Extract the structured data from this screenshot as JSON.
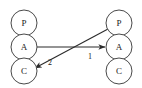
{
  "diagram": {
    "type": "graph",
    "canvas": {
      "width": 142,
      "height": 88,
      "background": "#ffffff"
    },
    "style": {
      "node_stroke": "#4a4a4a",
      "node_fill": "#ffffff",
      "edge_color": "#2b2b2b",
      "text_color": "#1a1a1a"
    },
    "columns": [
      {
        "name": "left-column",
        "cx": 24,
        "nodes": [
          {
            "id": "left-p",
            "label": "P",
            "cx": 24,
            "cy": 23,
            "r": 13
          },
          {
            "id": "left-a",
            "label": "A",
            "cx": 24,
            "cy": 47,
            "r": 13
          },
          {
            "id": "left-c",
            "label": "C",
            "cx": 24,
            "cy": 71,
            "r": 13
          }
        ]
      },
      {
        "name": "right-column",
        "cx": 119,
        "nodes": [
          {
            "id": "right-p",
            "label": "P",
            "cx": 119,
            "cy": 23,
            "r": 13
          },
          {
            "id": "right-a",
            "label": "A",
            "cx": 119,
            "cy": 47,
            "r": 13
          },
          {
            "id": "right-c",
            "label": "C",
            "cx": 119,
            "cy": 71,
            "r": 13
          }
        ]
      }
    ],
    "edges": [
      {
        "id": "edge-1",
        "label": "1",
        "from": "left-a",
        "to": "right-a",
        "arrowhead": "to",
        "label_x": 90,
        "label_y": 56
      },
      {
        "id": "edge-2",
        "label": "2",
        "from": "right-p",
        "to": "left-c",
        "arrowhead": "both",
        "label_x": 50,
        "label_y": 62
      }
    ]
  }
}
